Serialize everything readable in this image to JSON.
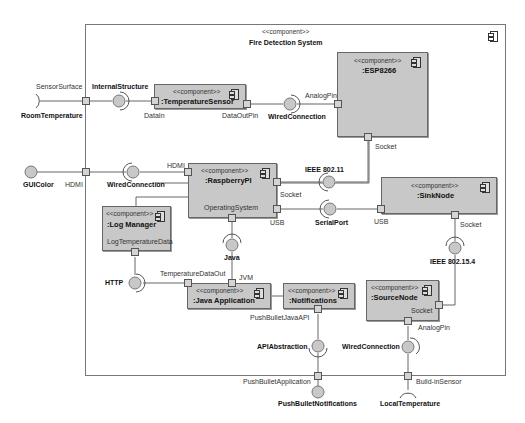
{
  "system": {
    "stereotype": "<<component>>",
    "title": "Fire Detection System"
  },
  "components": {
    "temperature_sensor": {
      "stereotype": "<<component>>",
      "name": ":TemperatureSensor"
    },
    "esp8266": {
      "stereotype": "<<component>>",
      "name": ":ESP8266"
    },
    "raspberry_pi": {
      "stereotype": "<<component>>",
      "name": ":RaspberryPI",
      "internal_label": "OperatingSystem"
    },
    "sink_node": {
      "stereotype": "<<component>>",
      "name": ":SinkNode"
    },
    "log_manager": {
      "stereotype": "<<component>>",
      "name": ":Log Manager",
      "internal_label": "LogTemperatureData"
    },
    "java_application": {
      "stereotype": "<<component>>",
      "name": ":Java Application"
    },
    "notifications": {
      "stereotype": "<<component>>",
      "name": ":Notifications"
    },
    "source_node": {
      "stereotype": "<<component>>",
      "name": ":SourceNode",
      "internal_label": "Socket"
    }
  },
  "ports": {
    "sensor_surface": "SensorSurface",
    "data_in": "DataIn",
    "data_out_pin": "DataOutPin",
    "analog_pin_esp": "AnalogPin",
    "socket_esp": "Socket",
    "hdmi_boundary": "HDMI",
    "hdmi_rpi": "HDMI",
    "socket_rpi": "Socket",
    "usb_rpi": "USB",
    "usb_sink": "USB",
    "socket_sink": "Socket",
    "temperature_data_out": "TemperatureDataOut",
    "jvm": "JVM",
    "push_bullet_java_api": "PushBulletJavaAPI",
    "analog_pin_source": "AnalogPin",
    "push_bullet_application": "PushBulletApplication",
    "build_in_sensor": "Build-inSensor"
  },
  "interfaces": {
    "room_temperature": "RoomTemperature",
    "internal_structure": "InternalStructure",
    "wired_connection_top": "WiredConnection",
    "gui_color": "GUIColor",
    "wired_connection_hdmi": "WiredConnection",
    "ieee_80211": "IEEE 802.11",
    "serial_port": "SerialPort",
    "java": "Java",
    "http": "HTTP",
    "ieee_802154": "IEEE 802.15.4",
    "api_abstraction": "APIAbstraction",
    "wired_connection_bottom": "WiredConnection",
    "push_bullet_notifications": "PushBulletNotifications",
    "local_temperature": "LocalTemperature"
  }
}
